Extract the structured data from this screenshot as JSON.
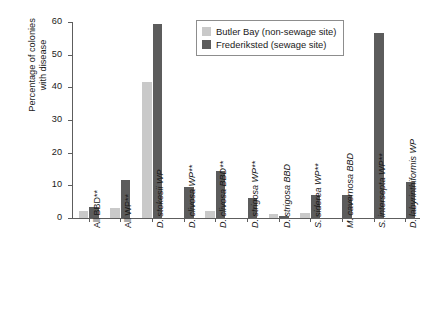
{
  "chart_data": {
    "type": "bar",
    "title": "",
    "subtitle": "",
    "xlabel": "",
    "ylabel": "Percentage of colonies with disease",
    "ylabel_line1": "Percentage of colonies",
    "ylabel_line2": "with disease",
    "ylim": [
      0,
      60
    ],
    "yticks": [
      0,
      10,
      20,
      30,
      40,
      50,
      60
    ],
    "ytick_labels": [
      "0",
      "10",
      "20",
      "30",
      "40",
      "50",
      "60"
    ],
    "grid": false,
    "legend_position": "top-right",
    "categories": [
      "All BBD**",
      "All WP**",
      "D. stokesii WP",
      "D. clivosa WP**",
      "D. clivosa BBD**",
      "D. strigosa WP**",
      "D. strigosa BBD",
      "S. siderea WP**",
      "M. cavernosa BBD",
      "S. intersepta WP**",
      "D. labyrinthiformis WP"
    ],
    "categories_italic": [
      false,
      false,
      true,
      true,
      true,
      true,
      true,
      true,
      true,
      true,
      true
    ],
    "series": [
      {
        "name": "Butler Bay (non-sewage site)",
        "color": "#c9c9c9",
        "values": [
          2.0,
          3.0,
          41.5,
          0,
          2.3,
          0,
          1.2,
          1.5,
          0,
          0,
          0
        ]
      },
      {
        "name": "Frederiksted (sewage site)",
        "color": "#5c5c5c",
        "values": [
          3.5,
          11.5,
          59.5,
          9.5,
          14.5,
          6.0,
          0.7,
          7.0,
          7.0,
          56.5,
          11.0
        ]
      }
    ]
  },
  "legend": {
    "items": [
      {
        "label": "Butler Bay (non-sewage site)",
        "swatch": "light"
      },
      {
        "label": "Frederiksted (sewage site)",
        "swatch": "dark"
      }
    ]
  }
}
